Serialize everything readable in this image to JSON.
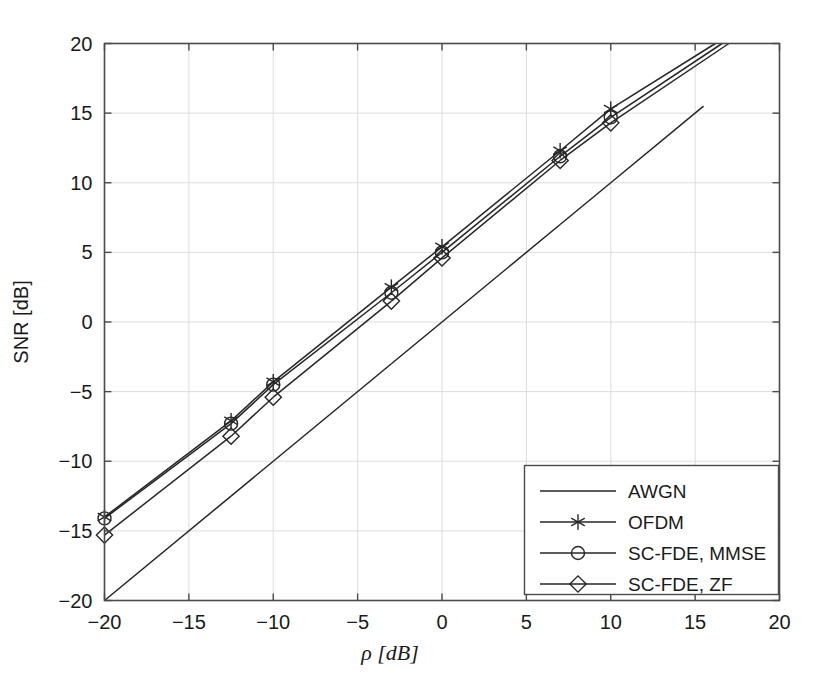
{
  "chart_data": {
    "type": "line",
    "title": "",
    "xlabel": "ρ [dB]",
    "ylabel": "SNR [dB]",
    "xlim": [
      -20,
      20
    ],
    "ylim": [
      -20,
      20
    ],
    "xticks": [
      -20,
      -15,
      -10,
      -5,
      0,
      5,
      10,
      15,
      20
    ],
    "yticks": [
      -20,
      -15,
      -10,
      -5,
      0,
      5,
      10,
      15,
      20
    ],
    "xtick_labels": [
      "-20",
      "-15",
      "-10",
      "-5",
      "0",
      "5",
      "10",
      "15",
      "20"
    ],
    "ytick_labels": [
      "-20",
      "-15",
      "-10",
      "-5",
      "0",
      "5",
      "10",
      "15",
      "20"
    ],
    "grid": true,
    "legend_position": "lower right",
    "series": [
      {
        "name": "AWGN",
        "marker": "none",
        "color": "#262626",
        "x": [
          -20,
          -12.5,
          -10,
          -3,
          0,
          7,
          10,
          15.5
        ],
        "y": [
          -20.0,
          -12.5,
          -10.0,
          -3.0,
          0.0,
          7.0,
          10.0,
          15.5
        ]
      },
      {
        "name": "OFDM",
        "marker": "asterisk",
        "color": "#262626",
        "x": [
          -20,
          -12.5,
          -10,
          -3,
          0,
          7,
          10,
          16.2
        ],
        "y": [
          -14.0,
          -7.1,
          -4.3,
          2.5,
          5.4,
          12.3,
          15.3,
          20.0
        ],
        "marker_x": [
          -20,
          -12.5,
          -10,
          -3,
          0,
          7,
          10
        ],
        "marker_y": [
          -14.0,
          -7.1,
          -4.3,
          2.5,
          5.4,
          12.3,
          15.3
        ]
      },
      {
        "name": "SC-FDE, MMSE",
        "marker": "circle",
        "color": "#262626",
        "x": [
          -20,
          -12.5,
          -10,
          -3,
          0,
          7,
          10,
          16.6
        ],
        "y": [
          -14.1,
          -7.3,
          -4.5,
          2.1,
          5.0,
          11.9,
          14.7,
          20.0
        ],
        "marker_x": [
          -20,
          -12.5,
          -10,
          -3,
          0,
          7,
          10
        ],
        "marker_y": [
          -14.1,
          -7.3,
          -4.5,
          2.1,
          5.0,
          11.9,
          14.7
        ]
      },
      {
        "name": "SC-FDE, ZF",
        "marker": "diamond",
        "color": "#262626",
        "x": [
          -20,
          -12.5,
          -10,
          -3,
          0,
          7,
          10,
          17.0
        ],
        "y": [
          -15.3,
          -8.2,
          -5.4,
          1.5,
          4.6,
          11.6,
          14.3,
          20.0
        ],
        "marker_x": [
          -20,
          -12.5,
          -10,
          -3,
          0,
          7,
          10
        ],
        "marker_y": [
          -15.3,
          -8.2,
          -5.4,
          1.5,
          4.6,
          11.6,
          14.3
        ]
      }
    ]
  },
  "legend": {
    "entries": [
      {
        "label": "AWGN",
        "marker": "none"
      },
      {
        "label": "OFDM",
        "marker": "asterisk"
      },
      {
        "label": "SC-FDE, MMSE",
        "marker": "circle"
      },
      {
        "label": "SC-FDE, ZF",
        "marker": "diamond"
      }
    ]
  },
  "colors": {
    "line": "#262626",
    "frame": "#4a4a4a",
    "grid": "#d9d9d9",
    "background": "#ffffff",
    "text": "#1a1a1a"
  }
}
